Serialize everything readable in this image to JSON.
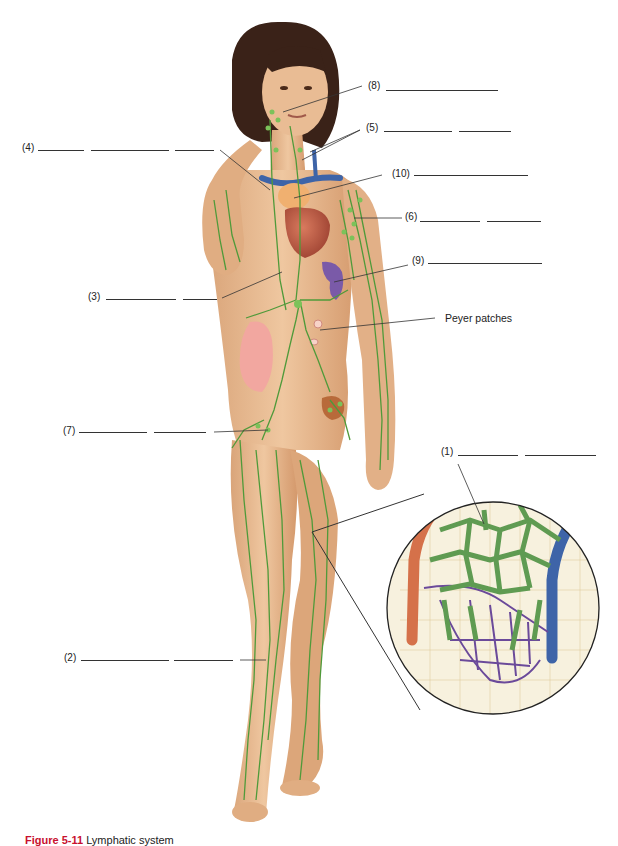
{
  "figure": {
    "title": "Lymphatic system",
    "caption_number": "Figure 5-11",
    "caption_text": "Lymphatic system",
    "colors": {
      "skin": "#e8b98f",
      "skin_shadow": "#c98f63",
      "hair": "#3a2218",
      "lymph": "#4f9a3a",
      "lymph_node": "#7cc25a",
      "vein": "#3e64a8",
      "artery": "#d5714a",
      "heart": "#b5543f",
      "thymus": "#f0b070",
      "spleen": "#7a5aa8",
      "intestine": "#f2a7a0",
      "line": "#333333",
      "caption_red": "#c8102e"
    }
  },
  "labels": [
    {
      "id": "1",
      "text": "(1)",
      "blanks": 2
    },
    {
      "id": "2",
      "text": "(2)",
      "blanks": 2
    },
    {
      "id": "3",
      "text": "(3)",
      "blanks": 2
    },
    {
      "id": "4",
      "text": "(4)",
      "blanks": 3
    },
    {
      "id": "5",
      "text": "(5)",
      "blanks": 2
    },
    {
      "id": "6",
      "text": "(6)",
      "blanks": 2
    },
    {
      "id": "7",
      "text": "(7)",
      "blanks": 2
    },
    {
      "id": "8",
      "text": "(8)",
      "blanks": 1
    },
    {
      "id": "9",
      "text": "(9)",
      "blanks": 1
    },
    {
      "id": "10",
      "text": "(10)",
      "blanks": 1
    }
  ],
  "named_labels": {
    "peyer": "Peyer patches"
  },
  "inset": {
    "description": "Magnified view of lymphatic capillaries among tissue cells and blood capillaries"
  }
}
